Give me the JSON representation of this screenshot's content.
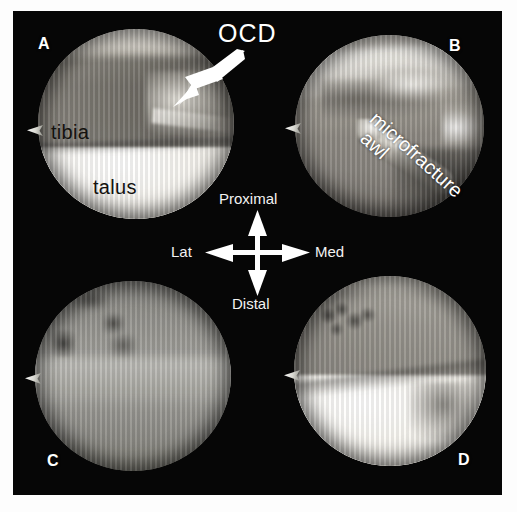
{
  "figure": {
    "background_color": "#ffffff",
    "plate_color": "#060606",
    "panels": [
      {
        "id": "A",
        "letter": "A",
        "letter_position": "top-left",
        "labels": [
          {
            "name": "tibia",
            "text": "tibia",
            "color": "#14120f"
          },
          {
            "name": "talus",
            "text": "talus",
            "color": "#14120f"
          }
        ]
      },
      {
        "id": "B",
        "letter": "B",
        "letter_position": "top-right",
        "labels": [
          {
            "name": "microfracture-awl",
            "text_line1": "microfracture",
            "text_line2": "awl",
            "color": "#ffffff"
          }
        ]
      },
      {
        "id": "C",
        "letter": "C",
        "letter_position": "bottom-left",
        "labels": []
      },
      {
        "id": "D",
        "letter": "D",
        "letter_position": "bottom-right",
        "labels": []
      }
    ],
    "callout": {
      "text": "OCD",
      "color": "#ffffff",
      "arrow": "arrow-down-left"
    },
    "compass": {
      "up": "Proximal",
      "down": "Distal",
      "left": "Lat",
      "right": "Med",
      "color": "#f2f2f2"
    }
  }
}
